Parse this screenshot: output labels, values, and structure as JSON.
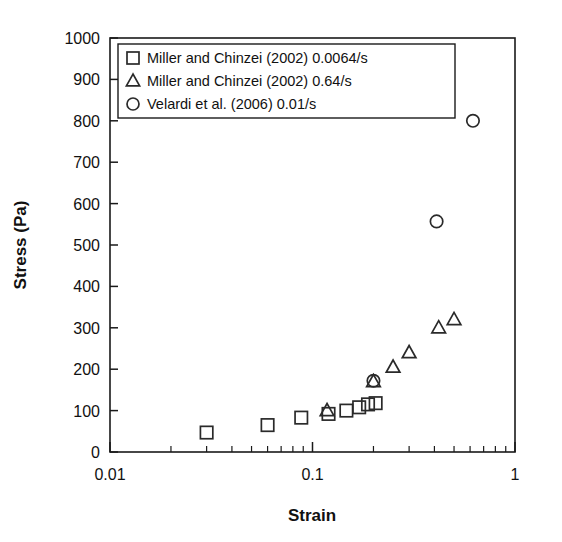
{
  "chart_data": {
    "type": "scatter",
    "title": "",
    "xlabel": "Strain",
    "ylabel": "Stress (Pa)",
    "xscale": "log",
    "yscale": "linear",
    "xlim": [
      0.01,
      1
    ],
    "ylim": [
      0,
      1000
    ],
    "xticks": [
      0.01,
      0.1,
      1
    ],
    "xtick_labels": [
      "0.01",
      "0.1",
      "1"
    ],
    "yticks": [
      0,
      100,
      200,
      300,
      400,
      500,
      600,
      700,
      800,
      900,
      1000
    ],
    "ytick_labels": [
      "0",
      "100",
      "200",
      "300",
      "400",
      "500",
      "600",
      "700",
      "800",
      "900",
      "1000"
    ],
    "grid": false,
    "legend_position": "top-left",
    "series": [
      {
        "name": "Miller and Chinzei (2002) 0.0064/s",
        "marker": "square",
        "points": [
          {
            "x": 0.03,
            "y": 47
          },
          {
            "x": 0.06,
            "y": 65
          },
          {
            "x": 0.088,
            "y": 83
          },
          {
            "x": 0.12,
            "y": 92
          },
          {
            "x": 0.147,
            "y": 100
          },
          {
            "x": 0.17,
            "y": 108
          },
          {
            "x": 0.188,
            "y": 115
          },
          {
            "x": 0.205,
            "y": 118
          }
        ]
      },
      {
        "name": "Miller and Chinzei (2002) 0.64/s",
        "marker": "triangle",
        "points": [
          {
            "x": 0.118,
            "y": 100
          },
          {
            "x": 0.2,
            "y": 170
          },
          {
            "x": 0.25,
            "y": 205
          },
          {
            "x": 0.3,
            "y": 240
          },
          {
            "x": 0.42,
            "y": 300
          },
          {
            "x": 0.5,
            "y": 320
          }
        ]
      },
      {
        "name": "Velardi et al. (2006) 0.01/s",
        "marker": "circle",
        "points": [
          {
            "x": 0.2,
            "y": 172
          },
          {
            "x": 0.41,
            "y": 557
          },
          {
            "x": 0.62,
            "y": 800
          }
        ]
      }
    ]
  },
  "legend": {
    "entries": [
      {
        "marker": "square",
        "label": "Miller and Chinzei (2002) 0.0064/s"
      },
      {
        "marker": "triangle",
        "label": "Miller and Chinzei (2002) 0.64/s"
      },
      {
        "marker": "circle",
        "label": "Velardi et al. (2006) 0.01/s"
      }
    ]
  },
  "colors": {
    "axis": "#1a1a1a",
    "marker": "#2a2a2a",
    "background": "#ffffff"
  }
}
